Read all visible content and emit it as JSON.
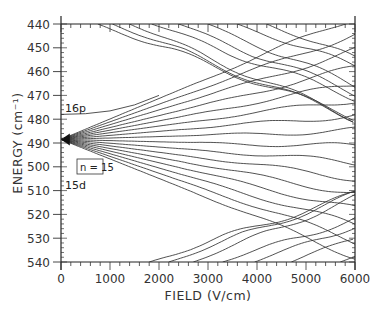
{
  "chart_data": {
    "type": "line",
    "title": "",
    "xlabel": "FIELD   (V/cm)",
    "ylabel": "ENERGY  (cm⁻¹)",
    "xlim": [
      0,
      6000
    ],
    "ylim": [
      440,
      540
    ],
    "y_inverted": true,
    "grid": false,
    "legend": null,
    "x_ticks": [
      0,
      1000,
      2000,
      3000,
      4000,
      5000,
      6000
    ],
    "x_tick_labels": [
      "0",
      "1000",
      "2000",
      "3000",
      "4000",
      "5000",
      "6000"
    ],
    "y_ticks": [
      440,
      450,
      460,
      470,
      480,
      490,
      500,
      510,
      520,
      530,
      540
    ],
    "y_tick_labels": [
      "440",
      "450",
      "460",
      "470",
      "480",
      "490",
      "500",
      "510",
      "520",
      "530",
      "540"
    ],
    "annotations": [
      {
        "text": "16p",
        "x": 40,
        "y": 476.5
      },
      {
        "text": "n = 15",
        "x": 950,
        "y": 487.5,
        "boxed": true
      },
      {
        "text": "15d",
        "x": 40,
        "y": 493.5
      }
    ],
    "fan_origin": {
      "x": 0,
      "y": 488.5
    },
    "fan_slopes_per_1000Vcm": [
      -8.6,
      -7.4,
      -6.2,
      -5.0,
      -3.9,
      -2.8,
      -1.7,
      -0.6,
      0.5,
      1.6,
      2.7,
      3.8,
      4.9,
      6.0,
      7.1,
      8.2
    ],
    "series": [
      {
        "name": "16p",
        "x": [
          0,
          500,
          1000,
          1500,
          2000
        ],
        "y": [
          478,
          477.7,
          476.5,
          474,
          470
        ]
      },
      {
        "name": "upper manifold (n=16) lines",
        "entry_points": [
          [
            750,
            440
          ],
          [
            1050,
            440
          ],
          [
            1400,
            440
          ],
          [
            1850,
            440
          ],
          [
            2400,
            440
          ],
          [
            3000,
            440
          ],
          [
            3600,
            440
          ],
          [
            4200,
            440
          ]
        ]
      },
      {
        "name": "lower manifold (n=14) lines",
        "entry_points": [
          [
            1800,
            540
          ],
          [
            2200,
            540
          ],
          [
            2700,
            540
          ],
          [
            3300,
            540
          ],
          [
            3950,
            540
          ],
          [
            4700,
            540
          ],
          [
            5700,
            540
          ]
        ]
      }
    ]
  },
  "labels": {
    "xlabel": "FIELD   (V/cm)",
    "ylabel": "ENERGY  (cm⁻¹)",
    "p16": "16p",
    "n15": "n = 15",
    "d15": "15d"
  },
  "style": {
    "line_color": "#333333",
    "axis_color": "#222222",
    "background": "#ffffff"
  }
}
